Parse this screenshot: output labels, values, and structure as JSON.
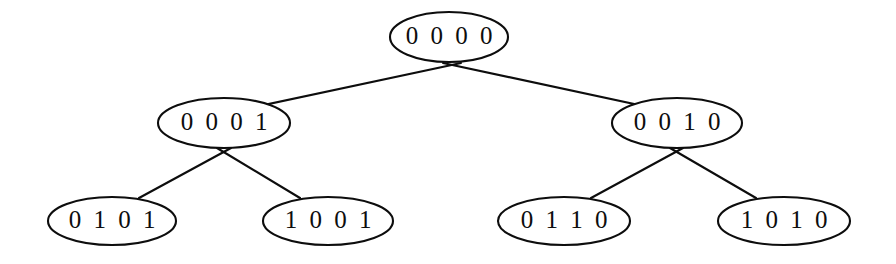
{
  "figure": {
    "name": "binary-tree-diagram",
    "background_color": "#ffffff",
    "stroke_color": "#0d0d0d"
  },
  "tree": {
    "nodes": [
      {
        "id": "root",
        "label": "0 0 0 0",
        "value": "0000",
        "level": 0,
        "cx": 449,
        "cy": 37,
        "rx": 59,
        "ry": 25
      },
      {
        "id": "n0001",
        "label": "0 0 0 1",
        "value": "0001",
        "level": 1,
        "cx": 224,
        "cy": 123,
        "rx": 66,
        "ry": 25
      },
      {
        "id": "n0010",
        "label": "0 0 1 0",
        "value": "0010",
        "level": 1,
        "cx": 677,
        "cy": 123,
        "rx": 65,
        "ry": 25
      },
      {
        "id": "n0101",
        "label": "0 1 0 1",
        "value": "0101",
        "level": 2,
        "cx": 112,
        "cy": 221,
        "rx": 64,
        "ry": 24
      },
      {
        "id": "n1001",
        "label": "1 0 0 1",
        "value": "1001",
        "level": 2,
        "cx": 328,
        "cy": 221,
        "rx": 65,
        "ry": 24
      },
      {
        "id": "n0110",
        "label": "0 1 1 0",
        "value": "0110",
        "level": 2,
        "cx": 564,
        "cy": 221,
        "rx": 66,
        "ry": 24
      },
      {
        "id": "n1010",
        "label": "1 0 1 0",
        "value": "1010",
        "level": 2,
        "cx": 784,
        "cy": 221,
        "rx": 66,
        "ry": 24
      }
    ],
    "edges": [
      {
        "id": "edge-root-0001",
        "from": "root",
        "to": "n0001",
        "x1": 461,
        "y1": 63,
        "x2": 212,
        "y2": 116
      },
      {
        "id": "edge-root-0010",
        "from": "root",
        "to": "n0010",
        "x1": 443,
        "y1": 63,
        "x2": 690,
        "y2": 116
      },
      {
        "id": "edge-0001-0101",
        "from": "n0001",
        "to": "n0101",
        "x1": 231,
        "y1": 148,
        "x2": 139,
        "y2": 198
      },
      {
        "id": "edge-0001-1001",
        "from": "n0001",
        "to": "n1001",
        "x1": 217,
        "y1": 148,
        "x2": 300,
        "y2": 198
      },
      {
        "id": "edge-0010-0110",
        "from": "n0010",
        "to": "n0110",
        "x1": 683,
        "y1": 148,
        "x2": 591,
        "y2": 198
      },
      {
        "id": "edge-0010-1010",
        "from": "n0010",
        "to": "n1010",
        "x1": 670,
        "y1": 148,
        "x2": 756,
        "y2": 198
      }
    ]
  }
}
